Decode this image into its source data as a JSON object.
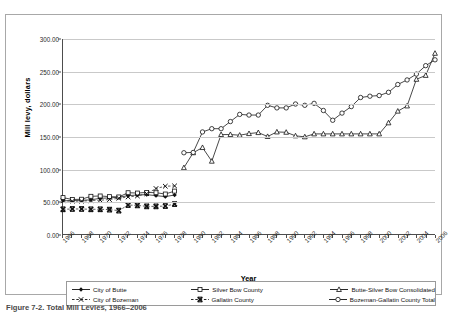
{
  "chart_data": {
    "type": "line",
    "title": "",
    "xlabel": "Year",
    "ylabel": "Mill levy, dollars",
    "xlim": [
      1966,
      2006
    ],
    "ylim": [
      0,
      300
    ],
    "yticks": [
      "0.00",
      "50.00",
      "100.00",
      "150.00",
      "200.00",
      "250.00",
      "300.00"
    ],
    "ytick_values": [
      0,
      50,
      100,
      150,
      200,
      250,
      300
    ],
    "xticks": [
      "1966",
      "1968",
      "1970",
      "1972",
      "1974",
      "1976",
      "1978",
      "1980",
      "1982",
      "1984",
      "1986",
      "1988",
      "1990",
      "1992",
      "1994",
      "1996",
      "1998",
      "2000",
      "2002",
      "2004",
      "2006"
    ],
    "xtick_values": [
      1966,
      1968,
      1970,
      1972,
      1974,
      1976,
      1978,
      1980,
      1982,
      1984,
      1986,
      1988,
      1990,
      1992,
      1994,
      1996,
      1998,
      2000,
      2002,
      2004,
      2006
    ],
    "grid": "horizontal",
    "legend_position": "bottom",
    "series": [
      {
        "name": "City of Butte",
        "marker": "filled-diamond",
        "x": [
          1966,
          1967,
          1968,
          1969,
          1970,
          1971,
          1972,
          1973,
          1974,
          1975,
          1976,
          1977,
          1978
        ],
        "values": [
          51.0,
          51.5,
          52.0,
          52.5,
          55.0,
          55.5,
          56.5,
          59.0,
          60.0,
          60.5,
          59.0,
          57.5,
          60.0
        ]
      },
      {
        "name": "Silver Bow County",
        "marker": "open-square",
        "x": [
          1966,
          1967,
          1968,
          1969,
          1970,
          1971,
          1972,
          1973,
          1974,
          1975,
          1976,
          1977,
          1978
        ],
        "values": [
          56.0,
          53.0,
          53.5,
          58.0,
          58.5,
          57.5,
          57.0,
          63.5,
          63.0,
          64.0,
          63.5,
          61.5,
          66.0
        ]
      },
      {
        "name": "Butte-Silver Bow Consolidated",
        "marker": "open-triangle",
        "x": [
          1979,
          1980,
          1981,
          1982,
          1983,
          1984,
          1985,
          1986,
          1987,
          1988,
          1989,
          1990,
          1991,
          1992,
          1993,
          1994,
          1995,
          1996,
          1997,
          1998,
          1999,
          2000,
          2001,
          2002,
          2003,
          2004,
          2005,
          2006
        ],
        "values": [
          102.0,
          125.0,
          133.0,
          112.0,
          153.0,
          153.0,
          152.0,
          154.5,
          156.0,
          150.0,
          157.0,
          156.5,
          151.0,
          149.5,
          154.0,
          154.0,
          154.0,
          154.0,
          154.0,
          154.0,
          154.0,
          154.0,
          171.0,
          189.0,
          197.0,
          238.0,
          244.0,
          278.0
        ]
      },
      {
        "name": "City of Bozeman",
        "marker": "x",
        "x": [
          1966,
          1967,
          1968,
          1969,
          1970,
          1971,
          1972,
          1973,
          1974,
          1975,
          1976,
          1977,
          1978
        ],
        "values": [
          51.0,
          50.5,
          50.5,
          51.5,
          52.0,
          53.0,
          55.0,
          57.0,
          58.5,
          62.0,
          70.0,
          73.5,
          74.0
        ]
      },
      {
        "name": "Gallatin County",
        "marker": "bold-x",
        "x": [
          1966,
          1967,
          1968,
          1969,
          1970,
          1971,
          1972,
          1973,
          1974,
          1975,
          1976,
          1977,
          1978
        ],
        "values": [
          38.0,
          38.5,
          38.5,
          38.0,
          38.0,
          37.5,
          36.0,
          44.5,
          44.0,
          42.5,
          42.5,
          43.0,
          46.0
        ]
      },
      {
        "name": "Bozeman-Gallatin County Total",
        "marker": "open-circle",
        "x": [
          1979,
          1980,
          1981,
          1982,
          1983,
          1984,
          1985,
          1986,
          1987,
          1988,
          1989,
          1990,
          1991,
          1992,
          1993,
          1994,
          1995,
          1996,
          1997,
          1998,
          1999,
          2000,
          2001,
          2002,
          2003,
          2004,
          2005,
          2006
        ],
        "values": [
          125.0,
          125.5,
          157.0,
          162.0,
          162.0,
          173.0,
          184.0,
          183.0,
          183.0,
          198.0,
          194.0,
          194.0,
          200.0,
          198.0,
          201.0,
          190.0,
          175.0,
          186.0,
          196.0,
          210.0,
          212.0,
          213.0,
          218.0,
          230.0,
          237.0,
          246.0,
          259.0,
          268.0
        ]
      }
    ]
  },
  "axis": {
    "y_title": "Mill levy, dollars",
    "x_title": "Year"
  },
  "legend": {
    "items": [
      {
        "label": "City of Butte",
        "marker": "filled-diamond"
      },
      {
        "label": "Silver Bow County",
        "marker": "open-square"
      },
      {
        "label": "Butte-Silver Bow Consolidated",
        "marker": "open-triangle"
      },
      {
        "label": "City of Bozeman",
        "marker": "x"
      },
      {
        "label": "Gallatin County",
        "marker": "bold-x"
      },
      {
        "label": "Bozeman-Gallatin County Total",
        "marker": "open-circle"
      }
    ]
  },
  "caption": "Figure 7-2.  Total Mill Levies, 1966–2006",
  "colors": {
    "series_line": "#1a1a1a",
    "grid": "#c9c9c9",
    "axis": "#4d4d4d",
    "frame": "#a8a8a8"
  }
}
